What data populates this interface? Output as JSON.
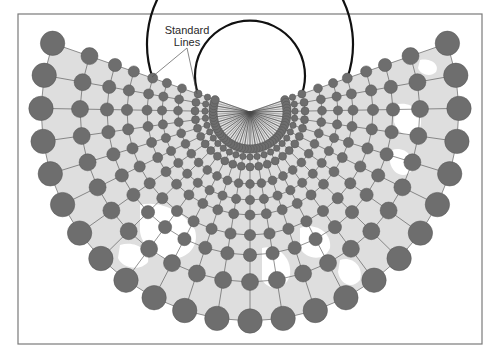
{
  "figure": {
    "label_line1": "Standard",
    "label_line2": "Lines",
    "frame": {
      "x": 18,
      "y": 14,
      "width": 464,
      "height": 330,
      "stroke": "#7a7a7a"
    },
    "colors": {
      "land": "#dedede",
      "ocean": "#ffffff",
      "circle_fill": "#6e6e6e",
      "circle_stroke": "#555555",
      "graticule": "#4a4a4a",
      "standard_line": "#111111",
      "label": "#2a2a2a"
    }
  },
  "projection": {
    "type": "conic-equidistant",
    "apex": [
      250,
      112
    ],
    "meridian_count": 25,
    "meridian_spacing_deg": 9.1,
    "center_angle_deg": 90,
    "outer_radius": 209,
    "inner_fan_radius": 30,
    "inner_fan_lines": 49,
    "rings": [
      {
        "r": 209,
        "circle_r": 12.2
      },
      {
        "r": 170,
        "circle_r": 8.5
      },
      {
        "r": 143,
        "circle_r": 6.6
      },
      {
        "r": 123,
        "circle_r": 5.6
      },
      {
        "r": 103,
        "circle_r": 5.0
      },
      {
        "r": 88,
        "circle_r": 4.6
      },
      {
        "r": 72,
        "circle_r": 4.4
      },
      {
        "r": 55,
        "circle_r": 4.0
      },
      {
        "r": 45,
        "circle_r": 3.2
      },
      {
        "r": 37,
        "circle_r": 4.2,
        "dense": true
      }
    ],
    "standard_lines": [
      103,
      55
    ],
    "leaders": [
      {
        "from": [
          187,
          48
        ],
        "to": [
          152,
          77
        ]
      },
      {
        "from": [
          187,
          48
        ],
        "to": [
          197,
          94
        ]
      }
    ],
    "label_position": [
      187,
      34
    ]
  },
  "ocean_patches": [
    "M140,205 C160,200 185,212 195,230 C200,248 185,262 165,258 C150,254 138,240 140,225 Z",
    "M120,245 C135,240 150,250 148,262 C140,272 122,268 118,258 Z",
    "M262,248 C278,244 292,258 290,275 C286,290 270,292 262,280 Z",
    "M300,228 C315,222 332,232 330,248 C325,262 306,260 300,248 Z",
    "M395,105 C410,100 425,112 420,128 C414,140 398,136 394,122 Z",
    "M392,150 C404,146 416,156 412,170 C405,180 392,174 390,162 Z",
    "M340,260 C352,256 364,266 360,280 C352,290 340,284 338,272 Z",
    "M420,60 C430,58 440,64 436,72 C430,78 420,74 418,68 Z"
  ]
}
